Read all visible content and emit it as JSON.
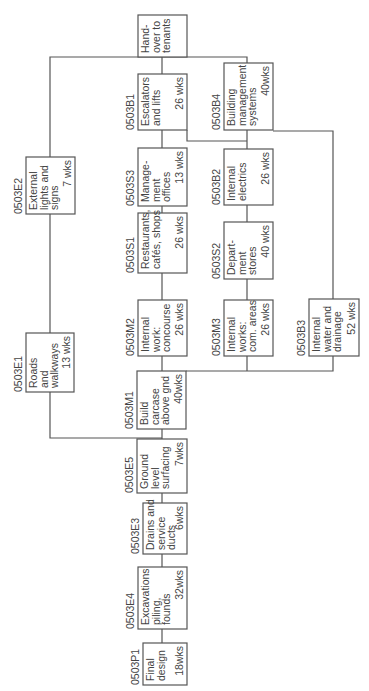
{
  "diagram": {
    "type": "precedence-network",
    "orientation": "rotated-90-ccw",
    "colors": {
      "line": "#555555",
      "text": "#444444",
      "background": "#ffffff"
    },
    "nodes": [
      {
        "id": "P1",
        "code": "0503P1",
        "lines": [
          "Final",
          "design"
        ],
        "duration": "18wks",
        "x": 143,
        "y": 643,
        "w": 44,
        "h": 42
      },
      {
        "id": "E4",
        "code": "0503E4",
        "lines": [
          "Excavations",
          "piling,",
          "founds"
        ],
        "duration": "32wks",
        "x": 138,
        "y": 567,
        "w": 49,
        "h": 62
      },
      {
        "id": "E3",
        "code": "0503E3",
        "lines": [
          "Drains and",
          "service",
          "ducts"
        ],
        "duration": "6wks",
        "x": 143,
        "y": 503,
        "w": 44,
        "h": 51
      },
      {
        "id": "E5",
        "code": "0503E5",
        "lines": [
          "Ground",
          "level",
          "surfacing"
        ],
        "duration": "7wks",
        "x": 137,
        "y": 439,
        "w": 50,
        "h": 54
      },
      {
        "id": "M1",
        "code": "0503M1",
        "lines": [
          "Build",
          "carcase",
          "above gnd"
        ],
        "duration": "40wks",
        "x": 137,
        "y": 371,
        "w": 49,
        "h": 58
      },
      {
        "id": "E1",
        "code": "0503E1",
        "lines": [
          "Roads",
          "and",
          "walkways"
        ],
        "duration": "13 wks",
        "x": 26,
        "y": 333,
        "w": 48,
        "h": 59
      },
      {
        "id": "M2",
        "code": "0503M2",
        "lines": [
          "Internal",
          "work:",
          "concourse"
        ],
        "duration": "26 wks",
        "x": 138,
        "y": 300,
        "w": 49,
        "h": 56
      },
      {
        "id": "M3",
        "code": "0503M3",
        "lines": [
          "Internal",
          "works:",
          "com. areas"
        ],
        "duration": "26 wks",
        "x": 224,
        "y": 300,
        "w": 49,
        "h": 56
      },
      {
        "id": "B3",
        "code": "0503B3",
        "lines": [
          "Internal",
          "water and",
          "drainage"
        ],
        "duration": "52 wks",
        "x": 309,
        "y": 299,
        "w": 50,
        "h": 57
      },
      {
        "id": "S1",
        "code": "0503S1",
        "lines": [
          "Restaurants,",
          "cafés, shops"
        ],
        "duration": "26 wks",
        "x": 138,
        "y": 213,
        "w": 49,
        "h": 60
      },
      {
        "id": "S2",
        "code": "0503S2",
        "lines": [
          "Depart-",
          "ment",
          "stores"
        ],
        "duration": "40 wks",
        "x": 224,
        "y": 222,
        "w": 49,
        "h": 57
      },
      {
        "id": "S3",
        "code": "0503S3",
        "lines": [
          "Manage-",
          "ment",
          "offices"
        ],
        "duration": "13 wks",
        "x": 138,
        "y": 148,
        "w": 49,
        "h": 58
      },
      {
        "id": "B2",
        "code": "0503B2",
        "lines": [
          "Internal",
          "electrics"
        ],
        "duration": "26 wks",
        "x": 224,
        "y": 149,
        "w": 49,
        "h": 56
      },
      {
        "id": "E2",
        "code": "0503E2",
        "lines": [
          "External",
          "lights and",
          "signs"
        ],
        "duration": "7 wks",
        "x": 26,
        "y": 157,
        "w": 49,
        "h": 57
      },
      {
        "id": "B1",
        "code": "0503B1",
        "lines": [
          "Escalators",
          "and lifts"
        ],
        "duration": "26 wks",
        "x": 138,
        "y": 74,
        "w": 49,
        "h": 56
      },
      {
        "id": "B4",
        "code": "0503B4",
        "lines": [
          "Building",
          "management",
          "systems"
        ],
        "duration": "40wks",
        "x": 224,
        "y": 63,
        "w": 49,
        "h": 67
      },
      {
        "id": "HO",
        "code": "",
        "lines": [
          "Hand-",
          "over to",
          "tenants"
        ],
        "duration": "",
        "x": 138,
        "y": 15,
        "w": 49,
        "h": 42
      }
    ],
    "connectors": [
      {
        "from": "P1",
        "to": "E4"
      },
      {
        "from": "E4",
        "to": "E3"
      },
      {
        "from": "E3",
        "to": "E5"
      },
      {
        "from": "E5",
        "to": "M1"
      },
      {
        "from": "E5",
        "to": "E1"
      },
      {
        "from": "M1",
        "to": "M2"
      },
      {
        "from": "M1",
        "to": "M3"
      },
      {
        "from": "M1",
        "to": "B3"
      },
      {
        "from": "M2",
        "to": "S1"
      },
      {
        "from": "M3",
        "to": "S2"
      },
      {
        "from": "S1",
        "to": "S3"
      },
      {
        "from": "S2",
        "to": "B2"
      },
      {
        "from": "S3",
        "to": "B1"
      },
      {
        "from": "B2",
        "to": "B4"
      },
      {
        "from": "B3",
        "to": "B4"
      },
      {
        "from": "B1",
        "to": "B2"
      },
      {
        "from": "E1",
        "to": "E2"
      },
      {
        "from": "E2",
        "to": "HO"
      },
      {
        "from": "B1",
        "to": "HO"
      },
      {
        "from": "B4",
        "to": "HO"
      }
    ]
  }
}
